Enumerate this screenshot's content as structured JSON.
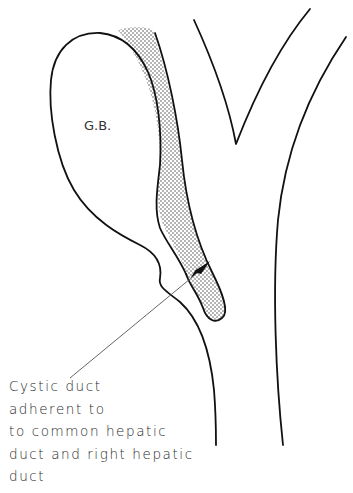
{
  "figure": {
    "labels": {
      "gallbladder": "G.B."
    },
    "caption_lines": [
      "Cystic duct",
      "adherent to",
      "to common hepatic",
      "duct and right hepatic",
      "duct"
    ],
    "colors": {
      "stroke": "#111111",
      "leader_line": "#555555",
      "stipple": "#444444",
      "background": "#ffffff"
    }
  }
}
